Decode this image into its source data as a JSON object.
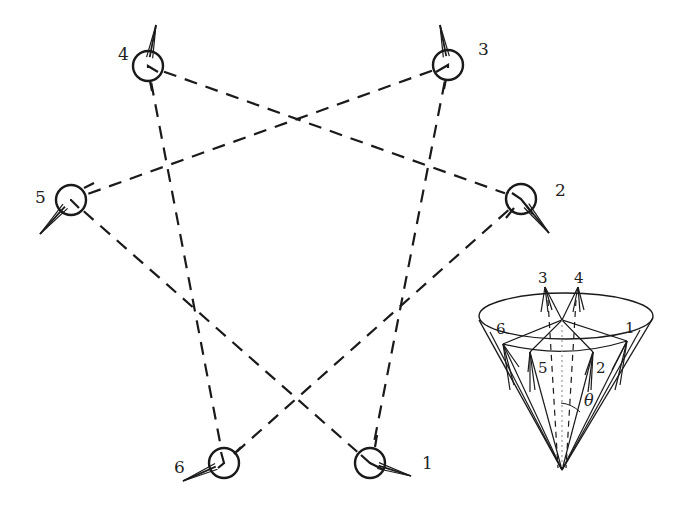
{
  "diagram": {
    "type": "sensor-array-with-cone-inset",
    "nodes": [
      {
        "id": "1",
        "label": "1",
        "cx": 370,
        "cy": 463,
        "lx": 422,
        "ly": 469,
        "arm": [
          [
            361,
            455
          ],
          [
            384,
            470
          ]
        ],
        "tip": [
          411,
          476
        ],
        "tick": [
          [
            375,
            447
          ],
          [
            377,
            435
          ]
        ]
      },
      {
        "id": "2",
        "label": "2",
        "cx": 521,
        "cy": 199,
        "lx": 555,
        "ly": 196,
        "arm": [
          [
            512,
            193
          ],
          [
            533,
            214
          ]
        ],
        "tip": [
          549,
          233
        ],
        "tick": [
          [
            514,
            208
          ],
          [
            506,
            218
          ]
        ]
      },
      {
        "id": "3",
        "label": "3",
        "cx": 448,
        "cy": 65,
        "lx": 478,
        "ly": 55,
        "arm": [
          [
            436,
            72
          ],
          [
            448,
            68
          ]
        ],
        "tip": [
          440,
          25
        ],
        "tick": [
          [
            446,
            79
          ],
          [
            444,
            89
          ]
        ]
      },
      {
        "id": "4",
        "label": "4",
        "cx": 148,
        "cy": 66,
        "lx": 118,
        "ly": 60,
        "arm": [
          [
            158,
            72
          ],
          [
            148,
            68
          ]
        ],
        "tip": [
          156,
          25
        ],
        "tick": [
          [
            150,
            81
          ],
          [
            152,
            91
          ]
        ]
      },
      {
        "id": "5",
        "label": "5",
        "cx": 71,
        "cy": 200,
        "lx": 35,
        "ly": 203,
        "arm": [
          [
            79,
            208
          ],
          [
            70,
            200
          ]
        ],
        "tip": [
          40,
          234
        ],
        "tick": [
          [
            84,
            188
          ],
          [
            94,
            183
          ]
        ]
      },
      {
        "id": "6",
        "label": "6",
        "cx": 224,
        "cy": 463,
        "lx": 174,
        "ly": 473,
        "arm": [
          [
            218,
            468
          ],
          [
            221,
            452
          ]
        ],
        "tip": [
          183,
          481
        ],
        "tick": [
          [
            234,
            454
          ],
          [
            241,
            447
          ]
        ]
      }
    ],
    "links": [
      {
        "from": "4",
        "to": "6"
      },
      {
        "from": "4",
        "to": "2"
      },
      {
        "from": "3",
        "to": "5"
      },
      {
        "from": "3",
        "to": "1"
      },
      {
        "from": "5",
        "to": "1"
      },
      {
        "from": "2",
        "to": "6"
      }
    ],
    "inset": {
      "title": "cone",
      "labels": {
        "n3": "3",
        "n4": "4",
        "n6": "6",
        "n1": "1",
        "n5": "5",
        "n2": "2",
        "angle": "θ"
      }
    }
  }
}
